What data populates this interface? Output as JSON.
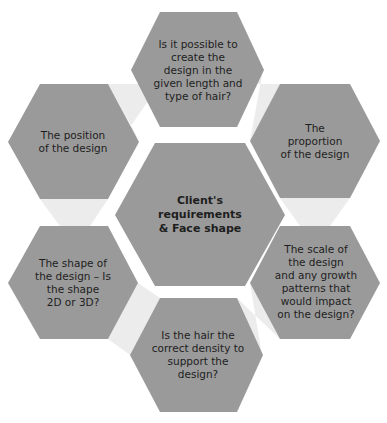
{
  "diagram": {
    "type": "hexagon-cluster",
    "colors": {
      "hexagon_fill": "#9a9a9a",
      "connector_fill": "#ececec",
      "background": "#ffffff",
      "text": "#1e1e1e"
    },
    "center": {
      "label": "Client's\nrequirements\n& Face shape"
    },
    "nodes": [
      {
        "id": "top",
        "label": "Is it possible to\ncreate the\ndesign in the\ngiven length and\ntype of hair?"
      },
      {
        "id": "upper-right",
        "label": "The\nproportion\nof the design"
      },
      {
        "id": "lower-right",
        "label": "The scale of\nthe design\nand any growth\npatterns that\nwould impact\non the design?"
      },
      {
        "id": "bottom",
        "label": "Is the hair the\ncorrect density to\nsupport the\ndesign?"
      },
      {
        "id": "lower-left",
        "label": "The shape of\nthe design – Is\nthe shape\n2D or 3D?"
      },
      {
        "id": "upper-left",
        "label": "The position\nof the design"
      }
    ]
  }
}
